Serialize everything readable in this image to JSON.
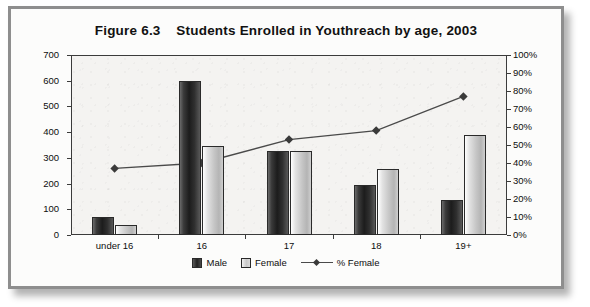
{
  "figure": {
    "title": "Figure 6.3    Students Enrolled in Youthreach by age, 2003",
    "frame_color": "#8e8e8e",
    "plot_background": "#f4f3f1"
  },
  "chart_data": {
    "type": "bar",
    "title": "Figure 6.3    Students Enrolled in Youthreach by age, 2003",
    "xlabel": "",
    "ylabel": "",
    "categories": [
      "under 16",
      "16",
      "17",
      "18",
      "19+"
    ],
    "series": [
      {
        "name": "Male",
        "type": "bar",
        "axis": "left",
        "values": [
          70,
          600,
          325,
          195,
          135
        ],
        "color": "#222222"
      },
      {
        "name": "Female",
        "type": "bar",
        "axis": "left",
        "values": [
          40,
          345,
          325,
          258,
          390
        ],
        "color": "#c9c9c9"
      },
      {
        "name": "% Female",
        "type": "line",
        "axis": "right",
        "values": [
          37,
          40,
          53,
          58,
          77
        ],
        "color": "#4a4a4a",
        "marker": "diamond"
      }
    ],
    "ylim": [
      0,
      700
    ],
    "ytick_step": 100,
    "yticks": [
      0,
      100,
      200,
      300,
      400,
      500,
      600,
      700
    ],
    "y2lim": [
      0,
      100
    ],
    "y2tick_step": 10,
    "y2ticks": [
      "0%",
      "10%",
      "20%",
      "30%",
      "40%",
      "50%",
      "60%",
      "70%",
      "80%",
      "90%",
      "100%"
    ],
    "grid": false,
    "legend_position": "bottom"
  },
  "legend": {
    "items": [
      {
        "label": "Male",
        "swatch": "male"
      },
      {
        "label": "Female",
        "swatch": "female"
      },
      {
        "label": "% Female",
        "swatch": "line"
      }
    ]
  }
}
